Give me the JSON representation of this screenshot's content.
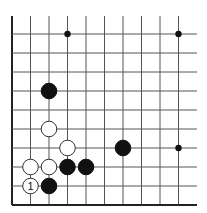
{
  "board": {
    "description": "Go board corner diagram (lower-left corner)",
    "grid": {
      "x0": 12,
      "dx": 18.5,
      "cols": 10,
      "right_extent": 197,
      "y0": 34,
      "dy": 19,
      "rows": 10,
      "top_extent": 16
    },
    "colors": {
      "line": "#555555",
      "edge": "#222222",
      "black": "#111111",
      "white": "#ffffff",
      "background": "#ffffff"
    },
    "star_points": [
      {
        "col": 3,
        "row": 0
      },
      {
        "col": 9,
        "row": 0
      },
      {
        "col": 9,
        "row": 6
      }
    ],
    "stones": [
      {
        "color": "black",
        "col": 2,
        "row": 3,
        "label": ""
      },
      {
        "color": "white",
        "col": 2,
        "row": 5,
        "label": ""
      },
      {
        "color": "white",
        "col": 3,
        "row": 6,
        "label": ""
      },
      {
        "color": "black",
        "col": 6,
        "row": 6,
        "label": ""
      },
      {
        "color": "white",
        "col": 1,
        "row": 7,
        "label": ""
      },
      {
        "color": "white",
        "col": 2,
        "row": 7,
        "label": ""
      },
      {
        "color": "black",
        "col": 3,
        "row": 7,
        "label": ""
      },
      {
        "color": "black",
        "col": 4,
        "row": 7,
        "label": ""
      },
      {
        "color": "white",
        "col": 1,
        "row": 8,
        "label": "1"
      },
      {
        "color": "black",
        "col": 2,
        "row": 8,
        "label": ""
      }
    ]
  }
}
